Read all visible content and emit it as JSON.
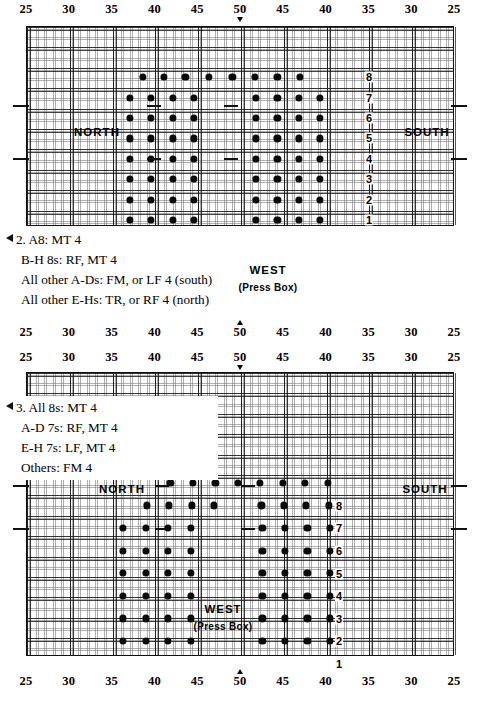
{
  "page": {
    "width": 480,
    "height": 703
  },
  "rulers": {
    "labels": [
      "25",
      "30",
      "35",
      "40",
      "45",
      "50",
      "45",
      "40",
      "35",
      "30",
      "25"
    ],
    "center_label": "50",
    "top": {
      "arrow": "arrow-down-marker"
    },
    "middle_upper": {
      "arrow": "arrow-up-marker"
    },
    "middle_lower": {
      "arrow": "arrow-down-marker"
    },
    "bottom": {
      "arrow": "arrow-up-marker"
    }
  },
  "fields": [
    {
      "id": "field-upper",
      "north_label": "NORTH",
      "south_label": "SOUTH",
      "west_label": "WEST",
      "press_box_label": "(Press Box)",
      "row_labels": [
        "1",
        "2",
        "3",
        "4",
        "5",
        "6",
        "7",
        "8"
      ]
    },
    {
      "id": "field-lower",
      "north_label": "NORTH",
      "south_label": "SOUTH",
      "west_label": "WEST",
      "press_box_label": "(Press Box)",
      "row_labels": [
        "1",
        "2",
        "3",
        "4",
        "5",
        "6",
        "7",
        "8"
      ]
    }
  ],
  "notes": [
    {
      "id": "note-2",
      "lines": [
        "2. A8: MT 4",
        "B-H 8s: RF, MT 4",
        "All other A-Ds: FM, or LF 4  (south)",
        "All other E-Hs: TR, or RF 4  (north)"
      ]
    },
    {
      "id": "note-3",
      "lines": [
        "3. All 8s: MT 4",
        "A-D 7s: RF, MT 4",
        "E-H 7s: LF, MT 4",
        "Others: FM 4"
      ]
    }
  ],
  "chart_data": {
    "type": "scatter",
    "xlabel": "Yard line",
    "ylabel": "Rank (front-to-back)",
    "x_ticks": [
      25,
      30,
      35,
      40,
      45,
      50,
      45,
      40,
      35,
      30,
      25
    ],
    "y_ticks": [
      1,
      2,
      3,
      4,
      5,
      6,
      7,
      8
    ],
    "charts": [
      {
        "name": "field-upper",
        "rows": [
          {
            "row": 8,
            "xs": [
              41.5,
              43.0,
              44.5,
              46.5,
              48.5,
              50.0,
              48.0,
              46.5,
              45.0,
              43.5
            ]
          },
          {
            "row": 7,
            "xs": [
              40.0,
              41.5,
              43.0,
              44.5,
              46.0,
              44.5,
              43.0,
              41.5,
              40.0
            ]
          },
          {
            "row": 6,
            "xs": [
              40.0,
              41.5,
              43.0,
              44.5,
              46.0,
              44.5,
              43.0,
              41.5,
              40.0
            ]
          },
          {
            "row": 5,
            "xs": [
              40.0,
              41.5,
              43.0,
              44.5,
              46.0,
              44.5,
              43.0,
              41.5,
              40.0
            ]
          },
          {
            "row": 4,
            "xs": [
              40.0,
              41.5,
              43.0,
              44.5,
              46.0,
              44.5,
              43.0,
              41.5,
              40.0
            ]
          },
          {
            "row": 3,
            "xs": [
              40.0,
              41.5,
              43.0,
              44.5,
              46.0,
              44.5,
              43.0,
              41.5,
              40.0
            ]
          },
          {
            "row": 2,
            "xs": [
              40.0,
              41.5,
              43.0,
              44.5,
              46.0,
              44.5,
              43.0,
              41.5,
              40.0
            ]
          },
          {
            "row": 1,
            "xs": [
              40.0,
              41.5,
              43.0,
              44.5,
              46.0,
              44.5,
              43.0,
              41.5,
              40.0
            ]
          }
        ]
      },
      {
        "name": "field-lower",
        "rows": [
          {
            "row": 8,
            "xs": [
              43.0,
              44.5,
              46.0,
              48.0,
              50.0,
              48.0,
              46.0,
              44.5
            ]
          },
          {
            "row": 7,
            "xs": [
              41.5,
              43.0,
              44.5,
              46.0,
              46.0,
              44.5,
              43.0,
              41.5
            ]
          },
          {
            "row": 6,
            "xs": [
              40.0,
              41.5,
              43.0,
              44.5,
              44.5,
              43.0,
              41.5,
              40.0
            ]
          },
          {
            "row": 5,
            "xs": [
              40.0,
              41.5,
              43.0,
              44.5,
              44.5,
              43.0,
              41.5,
              40.0
            ]
          },
          {
            "row": 4,
            "xs": [
              40.0,
              41.5,
              43.0,
              44.5,
              44.5,
              43.0,
              41.5,
              40.0
            ]
          },
          {
            "row": 3,
            "xs": [
              40.0,
              41.5,
              43.0,
              44.5,
              44.5,
              43.0,
              41.5,
              40.0
            ]
          },
          {
            "row": 2,
            "xs": [
              40.0,
              41.5,
              43.0,
              44.5,
              44.5,
              43.0,
              41.5,
              40.0
            ]
          },
          {
            "row": 1,
            "xs": [
              40.0,
              41.5,
              43.0,
              44.5,
              44.5,
              43.0,
              41.5,
              40.0
            ]
          }
        ]
      }
    ]
  }
}
